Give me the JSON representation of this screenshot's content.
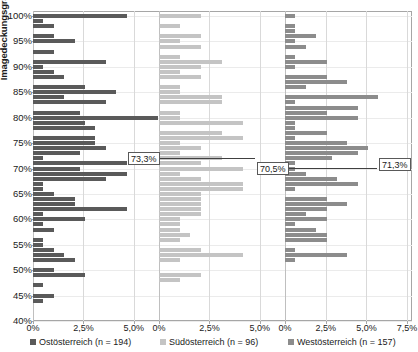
{
  "chart_data": {
    "type": "bar",
    "orientation": "horizontal",
    "title": "",
    "subtitle": "",
    "ylabel": "Imagedeckungsgrad",
    "xlabel": "",
    "grid": true,
    "legend_position": "bottom",
    "ylim": [
      40,
      101
    ],
    "y_tick_labels": [
      "100%",
      "95%",
      "90%",
      "85%",
      "80%",
      "75%",
      "70%",
      "65%",
      "60%",
      "55%",
      "50%",
      "45%",
      "40%"
    ],
    "y_tick_values": [
      100,
      95,
      90,
      85,
      80,
      75,
      70,
      65,
      60,
      55,
      50,
      45,
      40
    ],
    "panels": [
      {
        "name": "Ostösterreich",
        "legend_label": "Ostösterreich (n = 194)",
        "n": 194,
        "color": "#5a5a5a",
        "xlim": [
          0,
          6.25
        ],
        "x_tick_values": [
          0,
          2.5,
          5.0
        ],
        "x_tick_labels": [
          "0%",
          "2,5%",
          "5,0%"
        ],
        "mean_label": "73,3%",
        "mean_value": 73.3,
        "bars": [
          {
            "y": 100,
            "v": 4.65
          },
          {
            "y": 99,
            "v": 0.52
          },
          {
            "y": 98,
            "v": 1.03
          },
          {
            "y": 96,
            "v": 1.03
          },
          {
            "y": 95,
            "v": 2.06
          },
          {
            "y": 93,
            "v": 1.03
          },
          {
            "y": 91,
            "v": 3.61
          },
          {
            "y": 90,
            "v": 0.52
          },
          {
            "y": 89,
            "v": 1.03
          },
          {
            "y": 88,
            "v": 1.55
          },
          {
            "y": 86,
            "v": 2.58
          },
          {
            "y": 85,
            "v": 4.12
          },
          {
            "y": 84,
            "v": 1.55
          },
          {
            "y": 83,
            "v": 3.61
          },
          {
            "y": 81,
            "v": 2.32
          },
          {
            "y": 80,
            "v": 6.19
          },
          {
            "y": 79,
            "v": 2.58
          },
          {
            "y": 78,
            "v": 3.09
          },
          {
            "y": 76,
            "v": 3.09
          },
          {
            "y": 75,
            "v": 3.09
          },
          {
            "y": 74,
            "v": 3.61
          },
          {
            "y": 73,
            "v": 2.32
          },
          {
            "y": 72,
            "v": 0.52
          },
          {
            "y": 71,
            "v": 4.64
          },
          {
            "y": 70,
            "v": 2.32
          },
          {
            "y": 69,
            "v": 4.64
          },
          {
            "y": 68,
            "v": 3.61
          },
          {
            "y": 67,
            "v": 0.52
          },
          {
            "y": 66,
            "v": 0.52
          },
          {
            "y": 65,
            "v": 1.03
          },
          {
            "y": 64,
            "v": 2.06
          },
          {
            "y": 63,
            "v": 2.06
          },
          {
            "y": 62,
            "v": 4.64
          },
          {
            "y": 61,
            "v": 0.52
          },
          {
            "y": 60,
            "v": 2.58
          },
          {
            "y": 59,
            "v": 0.52
          },
          {
            "y": 58,
            "v": 1.03
          },
          {
            "y": 56,
            "v": 0.52
          },
          {
            "y": 55,
            "v": 0.52
          },
          {
            "y": 54,
            "v": 1.03
          },
          {
            "y": 53,
            "v": 1.55
          },
          {
            "y": 52,
            "v": 2.06
          },
          {
            "y": 50,
            "v": 1.03
          },
          {
            "y": 49,
            "v": 2.58
          },
          {
            "y": 47,
            "v": 0.52
          },
          {
            "y": 45,
            "v": 1.03
          },
          {
            "y": 44,
            "v": 0.52
          }
        ]
      },
      {
        "name": "Südösterreich",
        "legend_label": "Südösterreich (n = 96)",
        "n": 96,
        "color": "#c4c4c4",
        "xlim": [
          0,
          6.25
        ],
        "x_tick_values": [
          0,
          2.5,
          5.0
        ],
        "x_tick_labels": [
          "0%",
          "2,5%",
          "5,0%"
        ],
        "mean_label": "70,5%",
        "mean_value": 70.5,
        "bars": [
          {
            "y": 100,
            "v": 2.08
          },
          {
            "y": 98,
            "v": 1.04
          },
          {
            "y": 96,
            "v": 2.08
          },
          {
            "y": 95,
            "v": 1.04
          },
          {
            "y": 94,
            "v": 2.08
          },
          {
            "y": 92,
            "v": 1.04
          },
          {
            "y": 91,
            "v": 3.13
          },
          {
            "y": 90,
            "v": 2.08
          },
          {
            "y": 89,
            "v": 1.04
          },
          {
            "y": 88,
            "v": 2.08
          },
          {
            "y": 86,
            "v": 1.04
          },
          {
            "y": 85,
            "v": 1.04
          },
          {
            "y": 84,
            "v": 3.13
          },
          {
            "y": 83,
            "v": 3.13
          },
          {
            "y": 81,
            "v": 1.04
          },
          {
            "y": 80,
            "v": 1.04
          },
          {
            "y": 79,
            "v": 4.17
          },
          {
            "y": 77,
            "v": 3.13
          },
          {
            "y": 76,
            "v": 4.17
          },
          {
            "y": 75,
            "v": 1.04
          },
          {
            "y": 74,
            "v": 2.08
          },
          {
            "y": 73,
            "v": 1.04
          },
          {
            "y": 72,
            "v": 3.13
          },
          {
            "y": 71,
            "v": 2.08
          },
          {
            "y": 70,
            "v": 4.17
          },
          {
            "y": 69,
            "v": 1.04
          },
          {
            "y": 68,
            "v": 2.08
          },
          {
            "y": 67,
            "v": 4.17
          },
          {
            "y": 66,
            "v": 4.17
          },
          {
            "y": 65,
            "v": 2.08
          },
          {
            "y": 64,
            "v": 2.08
          },
          {
            "y": 63,
            "v": 2.08
          },
          {
            "y": 62,
            "v": 2.08
          },
          {
            "y": 61,
            "v": 2.08
          },
          {
            "y": 60,
            "v": 1.04
          },
          {
            "y": 59,
            "v": 1.04
          },
          {
            "y": 58,
            "v": 1.04
          },
          {
            "y": 57,
            "v": 1.56
          },
          {
            "y": 56,
            "v": 1.04
          },
          {
            "y": 54,
            "v": 2.08
          },
          {
            "y": 53,
            "v": 4.17
          },
          {
            "y": 52,
            "v": 1.04
          },
          {
            "y": 49,
            "v": 2.08
          },
          {
            "y": 48,
            "v": 1.04
          }
        ]
      },
      {
        "name": "Westösterreich",
        "legend_label": "Westösterreich (n = 157)",
        "n": 157,
        "color": "#8c8c8c",
        "xlim": [
          0,
          7.8
        ],
        "x_tick_values": [
          0,
          2.5,
          5.0,
          7.5
        ],
        "x_tick_labels": [
          "0%",
          "2,5%",
          "5,0%",
          "7,5%"
        ],
        "mean_label": "71,3%",
        "mean_value": 71.3,
        "bars": [
          {
            "y": 100,
            "v": 0.64
          },
          {
            "y": 98,
            "v": 0.64
          },
          {
            "y": 97,
            "v": 0.64
          },
          {
            "y": 96,
            "v": 1.91
          },
          {
            "y": 95,
            "v": 0.64
          },
          {
            "y": 94,
            "v": 1.27
          },
          {
            "y": 92,
            "v": 0.64
          },
          {
            "y": 91,
            "v": 2.55
          },
          {
            "y": 90,
            "v": 0.64
          },
          {
            "y": 88,
            "v": 2.55
          },
          {
            "y": 87,
            "v": 3.82
          },
          {
            "y": 86,
            "v": 1.27
          },
          {
            "y": 84,
            "v": 5.73
          },
          {
            "y": 83,
            "v": 0.64
          },
          {
            "y": 82,
            "v": 4.46
          },
          {
            "y": 81,
            "v": 2.55
          },
          {
            "y": 80,
            "v": 4.46
          },
          {
            "y": 79,
            "v": 0.64
          },
          {
            "y": 78,
            "v": 0.64
          },
          {
            "y": 77,
            "v": 2.55
          },
          {
            "y": 76,
            "v": 0.64
          },
          {
            "y": 75,
            "v": 3.82
          },
          {
            "y": 74,
            "v": 5.1
          },
          {
            "y": 73,
            "v": 4.46
          },
          {
            "y": 72,
            "v": 2.87
          },
          {
            "y": 71,
            "v": 0.64
          },
          {
            "y": 70,
            "v": 0.64
          },
          {
            "y": 69,
            "v": 1.27
          },
          {
            "y": 68,
            "v": 3.18
          },
          {
            "y": 67,
            "v": 4.46
          },
          {
            "y": 66,
            "v": 0.64
          },
          {
            "y": 64,
            "v": 2.55
          },
          {
            "y": 63,
            "v": 3.82
          },
          {
            "y": 62,
            "v": 2.55
          },
          {
            "y": 61,
            "v": 1.27
          },
          {
            "y": 60,
            "v": 2.55
          },
          {
            "y": 59,
            "v": 0.64
          },
          {
            "y": 58,
            "v": 1.91
          },
          {
            "y": 57,
            "v": 2.55
          },
          {
            "y": 56,
            "v": 2.55
          },
          {
            "y": 54,
            "v": 0.64
          },
          {
            "y": 53,
            "v": 3.82
          },
          {
            "y": 52,
            "v": 0.64
          }
        ]
      }
    ]
  }
}
